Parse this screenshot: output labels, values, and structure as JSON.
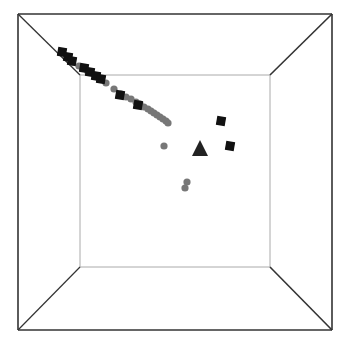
{
  "chart_data": {
    "type": "scatter",
    "title": "",
    "xlabel": "",
    "ylabel": "",
    "zlabel": "",
    "projection": "3d-box-perspective",
    "grid": false,
    "legend": null,
    "colors": {
      "gray_series": "#777777",
      "black_series": "#111111",
      "frame_outer": "#333333",
      "frame_inner": "#aaaaaa",
      "background": "#ffffff"
    },
    "frame": {
      "outer": [
        18,
        14,
        332,
        330
      ],
      "inner": [
        80,
        75,
        270,
        267
      ]
    },
    "series": [
      {
        "name": "gray-circles",
        "marker": "circle",
        "color": "#777777",
        "points": [
          [
            72,
            62
          ],
          [
            79,
            66
          ],
          [
            88,
            72
          ],
          [
            96,
            76
          ],
          [
            106,
            83
          ],
          [
            114,
            89
          ],
          [
            121,
            94
          ],
          [
            126,
            97
          ],
          [
            131,
            99
          ],
          [
            136,
            102
          ],
          [
            140,
            104
          ],
          [
            144,
            107
          ],
          [
            148,
            109
          ],
          [
            151,
            111
          ],
          [
            154,
            113
          ],
          [
            157,
            115
          ],
          [
            160,
            117
          ],
          [
            163,
            119
          ],
          [
            166,
            121
          ],
          [
            168,
            123
          ],
          [
            164,
            146
          ],
          [
            187,
            182
          ],
          [
            185,
            188
          ]
        ]
      },
      {
        "name": "black-squares",
        "marker": "square",
        "color": "#111111",
        "points": [
          [
            62,
            52
          ],
          [
            68,
            57
          ],
          [
            72,
            61
          ],
          [
            84,
            68
          ],
          [
            90,
            72
          ],
          [
            96,
            76
          ],
          [
            101,
            79
          ],
          [
            120,
            95
          ],
          [
            138,
            105
          ],
          [
            221,
            121
          ],
          [
            230,
            146
          ]
        ]
      },
      {
        "name": "black-triangle",
        "marker": "triangle",
        "color": "#222222",
        "points": [
          [
            200,
            148
          ]
        ]
      }
    ]
  }
}
